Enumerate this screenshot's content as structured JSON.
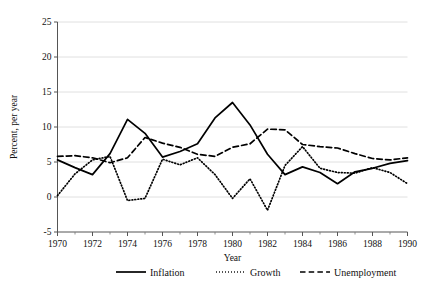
{
  "chart_data": {
    "type": "line",
    "title": "",
    "xlabel": "Year",
    "ylabel": "Percent, per year",
    "xlim": [
      1970,
      1990
    ],
    "ylim": [
      -5,
      25
    ],
    "ytick_values": [
      -5,
      0,
      5,
      10,
      15,
      20,
      25
    ],
    "ytick_labels": [
      "-5",
      "0",
      "5",
      "10",
      "15",
      "20",
      "25"
    ],
    "xtick_values": [
      1970,
      1972,
      1974,
      1976,
      1978,
      1980,
      1982,
      1984,
      1986,
      1988,
      1990
    ],
    "xtick_labels": [
      "1970",
      "1972",
      "1974",
      "1976",
      "1978",
      "1980",
      "1982",
      "1984",
      "1986",
      "1988",
      "1990"
    ],
    "minor_xticks": [
      1971,
      1973,
      1975,
      1977,
      1979,
      1981,
      1983,
      1985,
      1987,
      1989
    ],
    "grid": "horizontal",
    "legend_position": "below",
    "x": [
      1970,
      1971,
      1972,
      1973,
      1974,
      1975,
      1976,
      1977,
      1978,
      1979,
      1980,
      1981,
      1982,
      1983,
      1984,
      1985,
      1986,
      1987,
      1988,
      1989,
      1990
    ],
    "series": [
      {
        "name": "Inflation",
        "style": "solid",
        "color": "#000000",
        "values": [
          5.3,
          4.2,
          3.2,
          6.2,
          11.1,
          9.1,
          5.7,
          6.5,
          7.6,
          11.3,
          13.5,
          10.3,
          6.1,
          3.2,
          4.3,
          3.5,
          1.9,
          3.6,
          4.1,
          4.8,
          5.2
        ]
      },
      {
        "name": "Growth",
        "style": "dotted",
        "color": "#000000",
        "values": [
          0.2,
          3.3,
          5.3,
          5.8,
          -0.5,
          -0.2,
          5.4,
          4.6,
          5.6,
          3.2,
          -0.2,
          2.6,
          -1.9,
          4.5,
          7.2,
          4.1,
          3.5,
          3.4,
          4.2,
          3.5,
          1.9
        ]
      },
      {
        "name": "Unemployment",
        "style": "dashed",
        "color": "#000000",
        "values": [
          5.8,
          5.9,
          5.6,
          4.9,
          5.6,
          8.5,
          7.7,
          7.1,
          6.1,
          5.8,
          7.1,
          7.6,
          9.7,
          9.6,
          7.5,
          7.2,
          7.0,
          6.2,
          5.5,
          5.3,
          5.6
        ]
      }
    ]
  },
  "legend": {
    "items": [
      {
        "label": "Inflation",
        "style": "solid"
      },
      {
        "label": "Growth",
        "style": "dotted"
      },
      {
        "label": "Unemployment",
        "style": "dashed"
      }
    ]
  }
}
